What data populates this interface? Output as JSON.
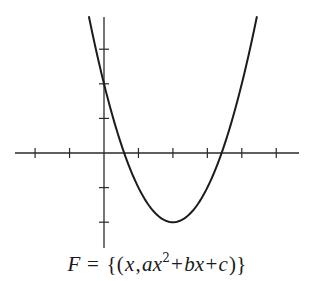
{
  "caption": {
    "F": "F",
    "eq": " = ",
    "open": "{(",
    "x": "x",
    "comma": ",",
    "a": "a",
    "x2": "x",
    "exp": "2",
    "plus1": "+",
    "b": "b",
    "x3": "x",
    "plus2": "+",
    "c": "c",
    "close": ")}",
    "full_text": "F = {(x, ax² + bx + c)}"
  },
  "colors": {
    "curve": "#1c1c1c",
    "axes": "#2a2a2a",
    "background": "#ffffff"
  },
  "chart_data": {
    "type": "line",
    "title": "",
    "caption": "F = {(x, ax² + bx + c)}",
    "xlabel": "",
    "ylabel": "",
    "grid": false,
    "legend": null,
    "function": "y = x^2 - 4x + 2 (a=1, b=-4, c=2; drawn as generic parabola ax^2+bx+c)",
    "coefficients": {
      "a": 1,
      "b": -4,
      "c": 2
    },
    "vertex": [
      2,
      -2
    ],
    "y_intercept": [
      0,
      2
    ],
    "roots": [
      0.586,
      3.414
    ],
    "x_ticks": [
      -2,
      -1,
      0,
      1,
      2,
      3,
      4,
      5
    ],
    "y_ticks": [
      -2,
      -1,
      1,
      2,
      3
    ],
    "xlim": [
      -2.6,
      5.7
    ],
    "ylim": [
      -2.7,
      3.95
    ],
    "tick_labels_shown": false,
    "series": [
      {
        "name": "parabola",
        "x": [
          -0.44,
          0,
          0.5,
          1,
          1.5,
          2,
          2.5,
          3,
          3.5,
          4,
          4.44
        ],
        "y": [
          3.95,
          2,
          0.25,
          -1,
          -1.75,
          -2,
          -1.75,
          -1,
          0.25,
          2,
          3.95
        ]
      }
    ]
  },
  "layout": {
    "origin_px": [
      104,
      153
    ],
    "unit_x_px": 34.45,
    "unit_y_px": 34.6,
    "x_axis_px": [
      15,
      299
    ],
    "y_axis_px": [
      17,
      248
    ],
    "tick_half_len_px": 5,
    "clip_top_px": 17
  }
}
